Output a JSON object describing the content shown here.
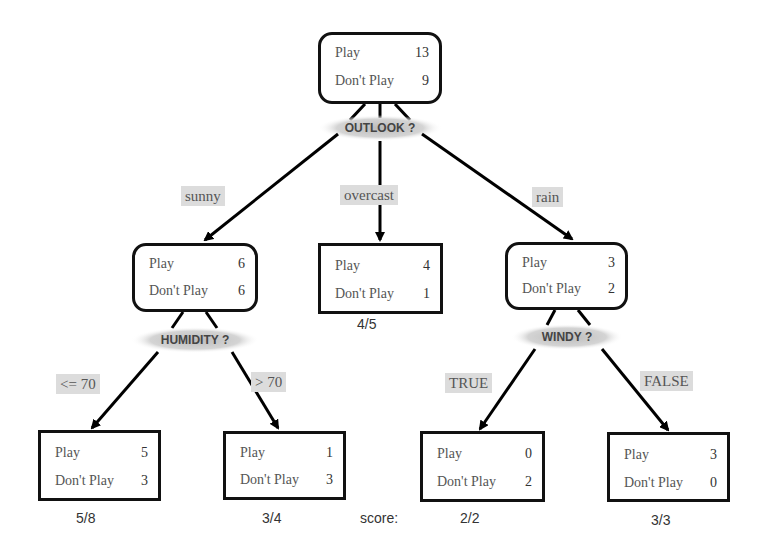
{
  "nodes": {
    "root": {
      "play_label": "Play",
      "play": "13",
      "dont_label": "Don't Play",
      "dont": "9"
    },
    "sunny": {
      "play_label": "Play",
      "play": "6",
      "dont_label": "Don't Play",
      "dont": "6"
    },
    "overcast": {
      "play_label": "Play",
      "play": "4",
      "dont_label": "Don't Play",
      "dont": "1"
    },
    "rain": {
      "play_label": "Play",
      "play": "3",
      "dont_label": "Don't Play",
      "dont": "2"
    },
    "humidity_low": {
      "play_label": "Play",
      "play": "5",
      "dont_label": "Don't Play",
      "dont": "3"
    },
    "humidity_high": {
      "play_label": "Play",
      "play": "1",
      "dont_label": "Don't Play",
      "dont": "3"
    },
    "windy_true": {
      "play_label": "Play",
      "play": "0",
      "dont_label": "Don't Play",
      "dont": "2"
    },
    "windy_false": {
      "play_label": "Play",
      "play": "3",
      "dont_label": "Don't Play",
      "dont": "0"
    }
  },
  "decisions": {
    "outlook": "OUTLOOK ?",
    "humidity": "HUMIDITY ?",
    "windy": "WINDY ?"
  },
  "edges": {
    "sunny": "sunny",
    "overcast": "overcast",
    "rain": "rain",
    "humidity_low": "<= 70",
    "humidity_high": "> 70",
    "windy_true": "TRUE",
    "windy_false": "FALSE"
  },
  "scores": {
    "label": "score:",
    "overcast": "4/5",
    "humidity_low": "5/8",
    "humidity_high": "3/4",
    "windy_true": "2/2",
    "windy_false": "3/3"
  }
}
